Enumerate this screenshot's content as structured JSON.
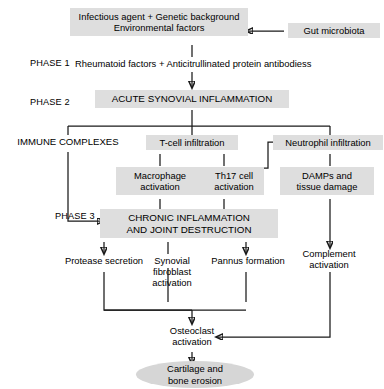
{
  "diagram": {
    "accent_shade": "#dedede",
    "line_color": "#1a1a1a",
    "phases": [
      {
        "id": "phase1",
        "label": "PHASE 1"
      },
      {
        "id": "phase2",
        "label": "PHASE 2"
      },
      {
        "id": "phase3",
        "label": "PHASE 3"
      }
    ],
    "nodes": [
      {
        "id": "trigger",
        "label": "Infectious agent + Genetic background\nEnvironmental factors",
        "style": "shaded"
      },
      {
        "id": "gut",
        "label": "Gut microbiota",
        "style": "shaded"
      },
      {
        "id": "autoantibodies",
        "label": "Rheumatoid factors + Anticitrullinated protein antibodiess",
        "style": "plain"
      },
      {
        "id": "acute",
        "label": "ACUTE SYNOVIAL INFLAMMATION",
        "style": "shaded"
      },
      {
        "id": "immune",
        "label": "IMMUNE COMPLEXES",
        "style": "plain"
      },
      {
        "id": "tcell",
        "label": "T-cell infiltration",
        "style": "shaded"
      },
      {
        "id": "neutrophil",
        "label": "Neutrophil infiltration",
        "style": "shaded"
      },
      {
        "id": "macrophage",
        "label": "Macrophage\nactivation",
        "style": "shaded"
      },
      {
        "id": "th17",
        "label": "Th17 cell\nactivation",
        "style": "shaded"
      },
      {
        "id": "damps",
        "label": "DAMPs and\ntissue damage",
        "style": "shaded"
      },
      {
        "id": "chronic",
        "label": "CHRONIC INFLAMMATION\nAND JOINT DESTRUCTION",
        "style": "shaded"
      },
      {
        "id": "protease",
        "label": "Protease secretion",
        "style": "plain"
      },
      {
        "id": "fibroblast",
        "label": "Synovial\nfibroblast\nactivation",
        "style": "plain"
      },
      {
        "id": "pannus",
        "label": "Pannus formation",
        "style": "plain"
      },
      {
        "id": "complement",
        "label": "Complement\nactivation",
        "style": "plain"
      },
      {
        "id": "osteoclast",
        "label": "Osteoclast\nactivation",
        "style": "plain"
      },
      {
        "id": "outcome",
        "label": "Cartilage and\nbone erosion",
        "style": "ellipse"
      }
    ]
  }
}
